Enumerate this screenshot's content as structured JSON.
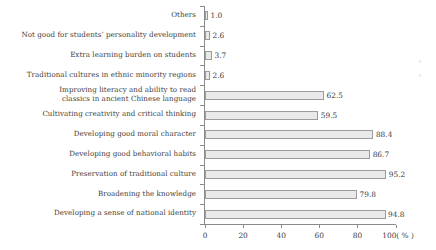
{
  "chart_data": {
    "type": "bar",
    "orientation": "horizontal",
    "title": "",
    "xlabel": "(%)",
    "ylabel": "",
    "xlim": [
      0,
      100
    ],
    "grid": false,
    "legend": null,
    "xticks": [
      "0",
      "20",
      "40",
      "60",
      "80",
      "100"
    ],
    "xtick_values": [
      0,
      20,
      40,
      60,
      80,
      100
    ],
    "xaxis_unit_label": "100( % )",
    "unit_suffix": "( % )",
    "categories": [
      "Others",
      "Not good for students’ personality development",
      "Extra learning burden on students",
      "Traditional cultures in ethnic minority regions",
      "Improving literacy and ability to read classics in ancient Chinese language",
      "Cultivating creativity and critical thinking",
      "Developing good moral character",
      "Developing good behavioral habits",
      "Preservation of traditional culture",
      "Broadening the knowledge",
      "Developing a sense of national identity"
    ],
    "category_lines": [
      [
        "Others"
      ],
      [
        "Not good for students’ personality development"
      ],
      [
        "Extra learning burden on students"
      ],
      [
        "Traditional cultures in ethnic minority regions"
      ],
      [
        "Improving literacy and ability to read",
        "classics in ancient Chinese language"
      ],
      [
        "Cultivating creativity and critical thinking"
      ],
      [
        "Developing good moral character"
      ],
      [
        "Developing good behavioral habits"
      ],
      [
        "Preservation of traditional culture"
      ],
      [
        "Broadening the knowledge"
      ],
      [
        "Developing a sense of national identity"
      ]
    ],
    "values": [
      1.0,
      2.6,
      3.7,
      2.6,
      62.5,
      59.5,
      88.4,
      86.7,
      95.2,
      79.8,
      94.8
    ],
    "value_labels": [
      "1.0",
      "2.6",
      "3.7",
      "2.6",
      "62.5",
      "59.5",
      "88.4",
      "86.7",
      "95.2",
      "79.8",
      "94.8"
    ],
    "colors": {
      "bar_fill": "#e9e9e9",
      "bar_border": "#9b9b9b",
      "axis": "#8a8a8a",
      "text": "#3d3d3d",
      "background": "#ffffff"
    }
  }
}
